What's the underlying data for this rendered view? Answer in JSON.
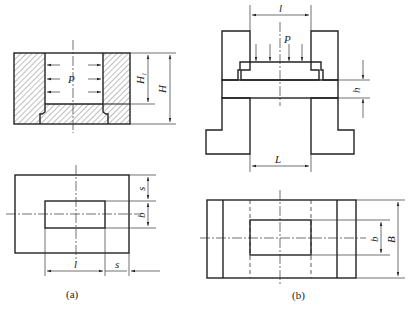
{
  "figure": {
    "background": "#ffffff",
    "line_color": "#222222"
  },
  "diagrams": [
    {
      "id": "a",
      "caption": "(a)",
      "section_view": {
        "load_label": "P",
        "load_direction": "lateral (arrows pointing outward toward walls)",
        "dimensions": {
          "inner_height": "H₁",
          "total_height": "H"
        }
      },
      "plan_view": {
        "dimensions": {
          "top_margin": "s",
          "inner_width": "b",
          "inner_length": "l",
          "side_margin": "s"
        }
      }
    },
    {
      "id": "b",
      "caption": "(b)",
      "section_view": {
        "load_label": "P",
        "load_direction": "downward onto plate",
        "dimensions": {
          "top_opening": "l",
          "plate_thickness": "h",
          "bottom_span": "L"
        }
      },
      "plan_view": {
        "dimensions": {
          "inner_width": "b",
          "total_width": "B"
        }
      }
    }
  ],
  "labels": {
    "a_P": "P",
    "a_H1": "H",
    "a_H1_sub": "1",
    "a_H": "H",
    "a_s_top": "s",
    "a_b": "b",
    "a_l": "l",
    "a_s_bottom": "s",
    "a_caption": "(a)",
    "b_l": "l",
    "b_P": "P",
    "b_h": "h",
    "b_L": "L",
    "b_b": "b",
    "b_B": "B",
    "b_caption": "(b)"
  }
}
